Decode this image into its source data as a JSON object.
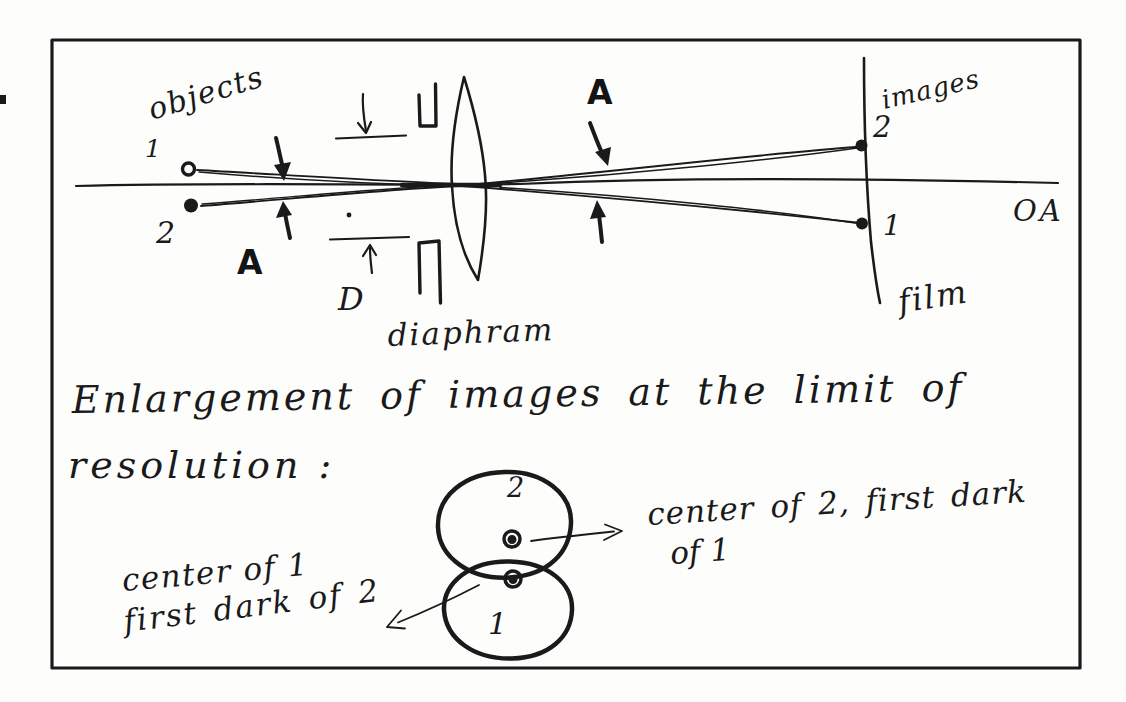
{
  "colors": {
    "ink": "#1a1a1a",
    "paper": "#fdfdfc"
  },
  "diagram": {
    "objects_label": "objects",
    "object_point_1": "1",
    "object_point_2": "2",
    "aperture_angle_left": "A",
    "aperture_angle_right": "A",
    "diameter_label": "D",
    "diaphragm_label": "diaphram",
    "images_label": "images",
    "image_point_2": "2",
    "image_point_1": "1",
    "film_label": "film",
    "optical_axis_label": "OA"
  },
  "caption": {
    "line1": "Enlargement of images at the limit of",
    "line2": "resolution :"
  },
  "enlargement": {
    "top_circle_label": "2",
    "bottom_circle_label": "1",
    "right_note_line1": "center of 2, first dark",
    "right_note_line2": "of 1",
    "left_note_line1": "center of 1",
    "left_note_line2": "first dark of 2"
  }
}
